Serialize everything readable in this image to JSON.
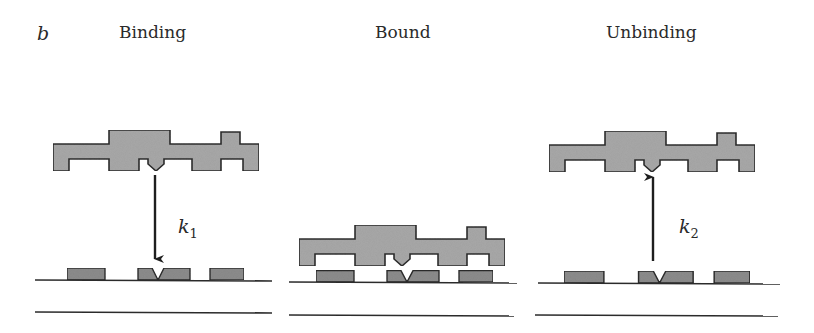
{
  "figure": {
    "panel_letter": "b",
    "panels": [
      {
        "id": "binding",
        "title": "Binding",
        "rate_constant": {
          "symbol": "k",
          "subscript": "1"
        },
        "arrow_direction": "down"
      },
      {
        "id": "bound",
        "title": "Bound"
      },
      {
        "id": "unbinding",
        "title": "Unbinding",
        "rate_constant": {
          "symbol": "k",
          "subscript": "2"
        },
        "arrow_direction": "up"
      }
    ],
    "colors": {
      "protein_fill": "#a8a8a8",
      "site_fill": "#8c8c8c",
      "stroke": "#2b2b2b",
      "text": "#2a2a2a"
    }
  }
}
